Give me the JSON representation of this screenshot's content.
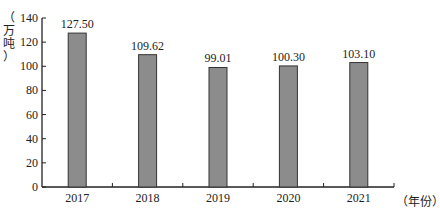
{
  "chart_data": {
    "type": "bar",
    "title": "",
    "xlabel": "（年份）",
    "ylabel": "（万吨）",
    "categories": [
      "2017",
      "2018",
      "2019",
      "2020",
      "2021"
    ],
    "values": [
      127.5,
      109.62,
      99.01,
      100.3,
      103.1
    ],
    "data_labels": [
      "127.50",
      "109.62",
      "99.01",
      "100.30",
      "103.10"
    ],
    "ylim": [
      0,
      140
    ],
    "yticks": [
      0,
      20,
      40,
      60,
      80,
      100,
      120,
      140
    ],
    "grid": false,
    "legend": null,
    "bar_color": "#8c8c8c",
    "bar_edge_color": "#333333"
  },
  "labels": {
    "y_unit_chars": [
      "（",
      "万",
      "吨",
      "）"
    ],
    "x_unit": "（年份）"
  }
}
